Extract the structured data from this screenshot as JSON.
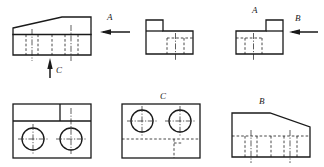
{
  "drawing": {
    "title": "Orthographic Projection Multi-View Engineering Drawing",
    "background_color": "#ffffff",
    "line_color": "#1a1a1a",
    "hidden_line_color": "#1a1a1a",
    "center_line_color": "#1a1a1a",
    "visible_line_width": 1.3,
    "hidden_line_width": 0.8,
    "center_line_width": 0.7,
    "view_count": 6,
    "arrow_count": 3
  },
  "labels": {
    "arrow_a_top_middle": "A",
    "arrow_c_bottom_left": "C",
    "arrow_a_top_right": "A",
    "arrow_b_top_right": "B",
    "view_c_bottom_middle": "C",
    "view_b_bottom_right": "B"
  },
  "views": [
    {
      "id": "view-top-left",
      "name": "front-view-wedge",
      "description": "Wedge shaped outline with sloped top edge, horizontal division line and vertical hidden lines",
      "position": {
        "x": 13,
        "y": 17,
        "width": 78,
        "height": 38
      },
      "features": [
        "sloped-top-edge",
        "horizontal-split-line",
        "hidden-vertical-lines",
        "center-lines"
      ]
    },
    {
      "id": "view-top-middle",
      "name": "l-shaped-view",
      "description": "L-shaped step profile with small raised block on the left and hidden lines on right base",
      "position": {
        "x": 146,
        "y": 20,
        "width": 47,
        "height": 34
      },
      "features": [
        "step-notch",
        "hidden-vertical-lines",
        "center-line"
      ]
    },
    {
      "id": "view-top-right",
      "name": "mirrored-l-shaped-view",
      "description": "Mirrored L-shaped step profile with raised block on the right and hidden lines on left base",
      "position": {
        "x": 236,
        "y": 20,
        "width": 47,
        "height": 34
      },
      "features": [
        "step-notch",
        "hidden-vertical-lines",
        "center-line"
      ]
    },
    {
      "id": "view-bottom-left",
      "name": "top-view-two-holes",
      "description": "Rectangular top view containing two circular holes with cross center lines and an upper band split",
      "position": {
        "x": 13,
        "y": 104,
        "width": 78,
        "height": 54
      },
      "features": [
        "two-circles",
        "cross-center-lines",
        "upper-band",
        "vertical-divider"
      ]
    },
    {
      "id": "view-bottom-middle",
      "name": "view-c-two-holes",
      "description": "Rectangular view C containing two circles above a horizontal hidden line and a hidden corner detail",
      "position": {
        "x": 122,
        "y": 104,
        "width": 78,
        "height": 54
      },
      "features": [
        "two-circles",
        "cross-center-lines",
        "horizontal-hidden-line",
        "hidden-corner"
      ]
    },
    {
      "id": "view-bottom-right",
      "name": "view-b-wedge",
      "description": "Wedge view B with sloped top edge and horizontal hidden line with vertical hidden ticks",
      "position": {
        "x": 232,
        "y": 110,
        "width": 78,
        "height": 47
      },
      "features": [
        "sloped-top-edge",
        "horizontal-hidden-line",
        "hidden-vertical-lines",
        "center-lines"
      ]
    }
  ],
  "arrows": [
    {
      "id": "arrow-a-horizontal",
      "name": "view-direction-arrow-a",
      "label": "A",
      "direction": "left",
      "position": {
        "x": 103,
        "y": 32,
        "length": 27
      }
    },
    {
      "id": "arrow-c-vertical",
      "name": "view-direction-arrow-c",
      "label": "C",
      "direction": "up",
      "position": {
        "x": 50,
        "y": 58,
        "length": 20
      }
    },
    {
      "id": "arrow-b-horizontal",
      "name": "view-direction-arrow-b",
      "label": "B",
      "direction": "left",
      "position": {
        "x": 292,
        "y": 32,
        "length": 26
      }
    }
  ]
}
